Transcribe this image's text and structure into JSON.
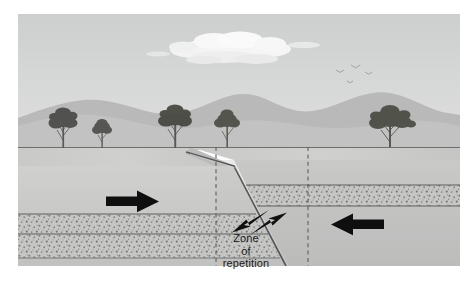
{
  "figure": {
    "annotations": {
      "zone_line1": "Zone",
      "zone_line2": "of",
      "zone_line3": "repetition"
    },
    "arrows": {
      "left_compression": "arrow pointing right",
      "right_compression": "arrow pointing left",
      "fault_slip_hanging_wall": "arrow pointing up-right along fault",
      "fault_slip_footwall": "arrow pointing down-left along fault"
    },
    "sky": {
      "cloud": "cumulus cloud",
      "birds": "three birds in flight"
    },
    "landscape": {
      "hills": "rolling hills horizon",
      "trees": "five trees on ground surface"
    },
    "strata": {
      "marker_bed": "stippled sandstone marker bed",
      "host_rock": "light gray rock"
    },
    "zone_boundaries": {
      "left_dashed": "dashed vertical boundary",
      "right_dashed": "dashed vertical boundary"
    },
    "colors": {
      "sky": "#d5d6d6",
      "cloud": "#fdfdfd",
      "hills_far": "#b8b9b9",
      "hills_near": "#c2c3c3",
      "ground_top": "#c9cac9",
      "rock_light": "#cfd0cf",
      "rock_mid": "#c4c5c4",
      "rock_dark": "#b6b7b6",
      "stipple_base": "#c8c9c7",
      "stipple_dot": "#7d7e7c",
      "line": "#4f504f",
      "arrow": "#111111",
      "text": "#1b1b1b",
      "frame": "#ffffff"
    },
    "fault": {
      "type": "thrust fault",
      "dip_direction": "dips to the right"
    }
  }
}
